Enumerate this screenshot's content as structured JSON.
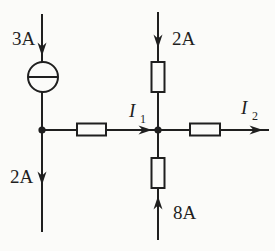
{
  "canvas": {
    "background": "#fbfbf9",
    "ink": "#1f1f1f"
  },
  "diagram": {
    "kind": "electrical-circuit",
    "components": {
      "current_source_count": 1,
      "resistor_count": 4,
      "node_count": 2
    }
  },
  "labels": {
    "source_current": "3A",
    "top_current": "2A",
    "left_current": "2A",
    "bottom_current": "8A",
    "i1_base": "I",
    "i1_sub": "1",
    "i2_base": "I",
    "i2_sub": "2"
  }
}
